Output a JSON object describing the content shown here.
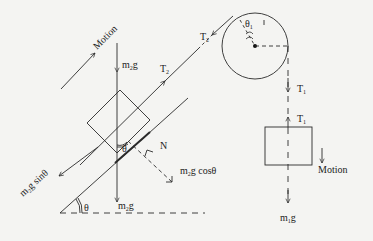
{
  "diagram": {
    "type": "free-body diagram: block on incline connected over pulley to hanging block",
    "labels": {
      "motion_incline": "Motion",
      "m2g_top": "m",
      "m2g_top_sub": "2",
      "m2g_top_g": "g",
      "t2_lower": "T",
      "t2_lower_sub": "2",
      "t2_upper": "T",
      "t2_upper_sub": "2",
      "theta1": "θ",
      "theta1_sub": "1",
      "t1_upper": "T",
      "t1_upper_sub": "1",
      "t1_lower": "T",
      "t1_lower_sub": "1",
      "theta_block": "θ",
      "normal": "N",
      "m2g_cos_m": "m",
      "m2g_cos_sub": "2",
      "m2g_cos_rest": "g cosθ",
      "m2g_sin_m": "m",
      "m2g_sin_sub": "2",
      "m2g_sin_rest": "g sinθ",
      "theta_base": "θ",
      "m2g_bottom": "m",
      "m2g_bottom_sub": "2",
      "m2g_bottom_g": "g",
      "motion_hanging": "Motion",
      "m1g": "m",
      "m1g_sub": "1",
      "m1g_g": "g"
    },
    "colors": {
      "stroke": "#2a2a2a",
      "background": "#f4f4f2"
    }
  }
}
